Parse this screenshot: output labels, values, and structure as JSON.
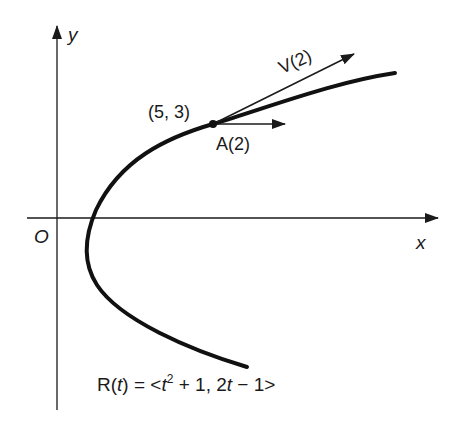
{
  "diagram": {
    "axes": {
      "x_label": "x",
      "y_label": "y",
      "origin_label": "O"
    },
    "point": {
      "label": "(5, 3)"
    },
    "vectors": {
      "velocity_label": "V(2)",
      "acceleration_label": "A(2)"
    },
    "equation": {
      "lhs_R": "R",
      "lhs_paren_open": "(",
      "lhs_t": "t",
      "lhs_paren_close": ")",
      "equals": " = ",
      "open_bracket": "<",
      "t1": "t",
      "exp": "2",
      "mid": " + 1, 2",
      "t2": "t",
      "tail": " − 1",
      "close_bracket": ">"
    },
    "colors": {
      "ink": "#1a1a1a",
      "background": "#ffffff"
    }
  }
}
